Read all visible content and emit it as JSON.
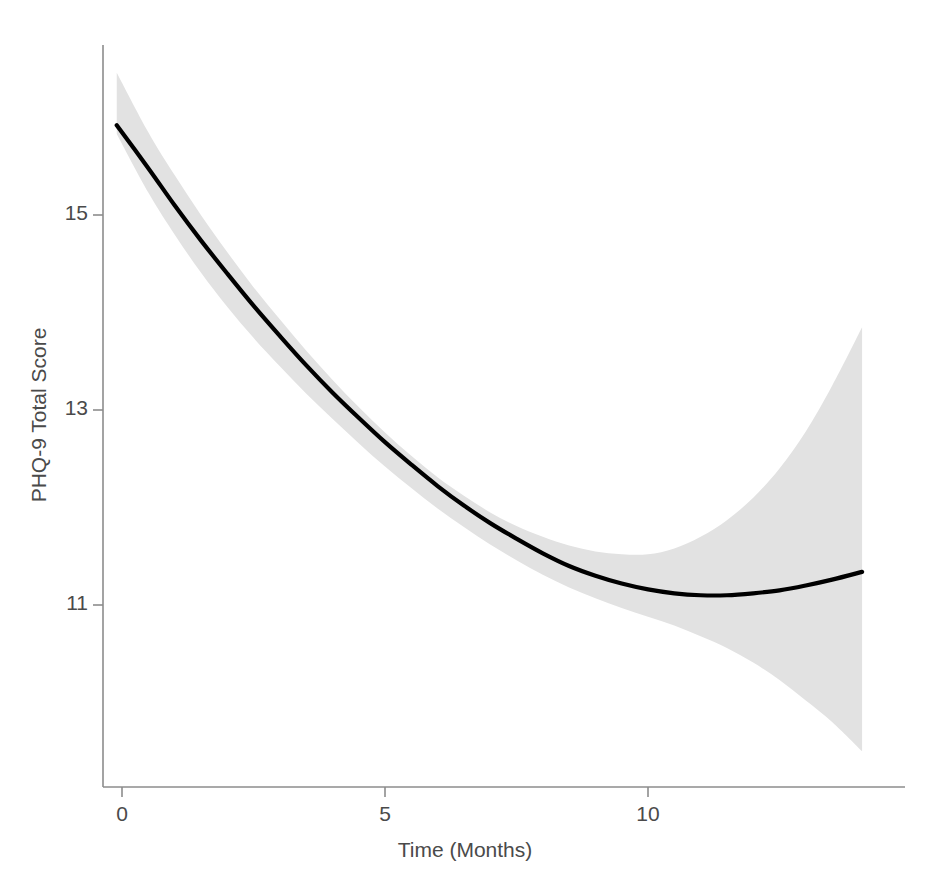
{
  "chart_data": {
    "type": "line",
    "title": "",
    "subtitle": "",
    "xlabel": "Time (Months)",
    "ylabel": "PHQ-9 Total Score",
    "xlim": [
      -0.6,
      14.3
    ],
    "ylim": [
      9.6,
      16.3
    ],
    "xticks": [
      0,
      5,
      10
    ],
    "xtick_labels": [
      "0",
      "5",
      "10"
    ],
    "yticks": [
      11,
      13,
      15
    ],
    "ytick_labels": [
      "11",
      "13",
      "15"
    ],
    "grid": false,
    "legend": "none",
    "annotations": [],
    "series": [
      {
        "name": "Predicted PHQ-9 Total Score",
        "style": "solid-black-line",
        "color": "#000000",
        "x": [
          -0.1,
          0.5,
          1.0,
          1.5,
          2.0,
          2.5,
          3.0,
          3.5,
          4.0,
          4.5,
          5.0,
          5.5,
          6.0,
          6.5,
          7.0,
          7.5,
          8.0,
          8.5,
          9.0,
          9.5,
          10.0,
          10.5,
          11.0,
          11.5,
          12.0,
          12.5,
          13.0,
          13.5,
          14.07
        ],
        "y": [
          15.92,
          15.48,
          15.1,
          14.74,
          14.4,
          14.07,
          13.76,
          13.46,
          13.18,
          12.92,
          12.67,
          12.44,
          12.22,
          12.02,
          11.84,
          11.68,
          11.53,
          11.4,
          11.3,
          11.22,
          11.16,
          11.12,
          11.1,
          11.1,
          11.12,
          11.15,
          11.2,
          11.26,
          11.34
        ]
      }
    ],
    "confidence_band": {
      "name": "95% Confidence Interval",
      "color": "#e2e2e2",
      "x": [
        -0.1,
        0.5,
        1.0,
        1.5,
        2.0,
        2.5,
        3.0,
        3.5,
        4.0,
        4.5,
        5.0,
        5.5,
        6.0,
        6.5,
        7.0,
        7.5,
        8.0,
        8.5,
        9.0,
        9.5,
        10.0,
        10.5,
        11.0,
        11.5,
        12.0,
        12.5,
        13.0,
        13.5,
        14.07
      ],
      "upper": [
        16.46,
        15.85,
        15.41,
        15.0,
        14.62,
        14.26,
        13.93,
        13.61,
        13.31,
        13.03,
        12.77,
        12.53,
        12.31,
        12.12,
        11.95,
        11.81,
        11.7,
        11.61,
        11.55,
        11.52,
        11.52,
        11.58,
        11.7,
        11.87,
        12.1,
        12.4,
        12.78,
        13.25,
        13.85
      ],
      "lower": [
        15.83,
        15.23,
        14.8,
        14.41,
        14.06,
        13.74,
        13.45,
        13.17,
        12.91,
        12.66,
        12.42,
        12.2,
        11.99,
        11.8,
        11.62,
        11.46,
        11.31,
        11.18,
        11.07,
        10.97,
        10.88,
        10.79,
        10.68,
        10.56,
        10.41,
        10.23,
        10.02,
        9.8,
        9.5
      ]
    }
  },
  "axes": {
    "x_axis_name": "time-months-axis",
    "y_axis_name": "phq9-score-axis"
  }
}
